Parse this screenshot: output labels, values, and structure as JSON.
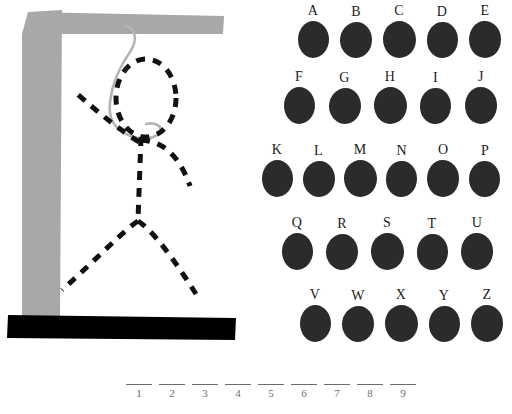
{
  "game": {
    "title": "Hangman",
    "colors": {
      "gallows_post": "#a8a8a8",
      "gallows_base": "#000000",
      "rope": "#b5b5b5",
      "figure_stroke": "#111111",
      "letter_blob": "#2b2b2b",
      "letter_text": "#1c1c1c",
      "blank_line": "#6b6b6b",
      "blank_number": "#6e6e6e",
      "background": "#ffffff"
    }
  },
  "gallows": {
    "post_label": "gallows-post",
    "beam_label": "gallows-beam",
    "base_label": "gallows-base",
    "rope_label": "rope",
    "figure_parts": [
      "head",
      "torso",
      "left-arm",
      "right-arm",
      "left-leg",
      "right-leg"
    ]
  },
  "letter_board": {
    "rows": [
      {
        "letters": [
          "A",
          "B",
          "C",
          "D",
          "E"
        ]
      },
      {
        "letters": [
          "F",
          "G",
          "H",
          "I",
          "J"
        ]
      },
      {
        "letters": [
          "K",
          "L",
          "M",
          "N",
          "O",
          "P"
        ]
      },
      {
        "letters": [
          "Q",
          "R",
          "S",
          "T",
          "U"
        ]
      },
      {
        "letters": [
          "V",
          "W",
          "X",
          "Y",
          "Z"
        ]
      }
    ]
  },
  "word_blanks": {
    "count": 9,
    "slots": [
      {
        "number": "1",
        "letter": ""
      },
      {
        "number": "2",
        "letter": ""
      },
      {
        "number": "3",
        "letter": ""
      },
      {
        "number": "4",
        "letter": ""
      },
      {
        "number": "5",
        "letter": ""
      },
      {
        "number": "6",
        "letter": ""
      },
      {
        "number": "7",
        "letter": ""
      },
      {
        "number": "8",
        "letter": ""
      },
      {
        "number": "9",
        "letter": ""
      }
    ]
  }
}
